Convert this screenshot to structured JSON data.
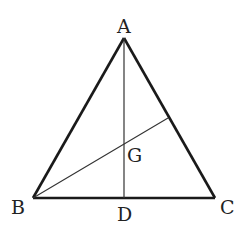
{
  "diagram": {
    "type": "triangle-with-cevians",
    "colors": {
      "stroke": "#1a1a1a",
      "label": "#222222",
      "background": "#ffffff"
    },
    "points": {
      "A": {
        "label": "A",
        "x": 124,
        "y": 38
      },
      "B": {
        "label": "B",
        "x": 33,
        "y": 198
      },
      "C": {
        "label": "C",
        "x": 215,
        "y": 198
      },
      "D": {
        "label": "D",
        "x": 124,
        "y": 198
      },
      "G": {
        "label": "G",
        "x": 124,
        "y": 143
      },
      "E": {
        "x": 168,
        "y": 118
      }
    },
    "segments": [
      {
        "from": "A",
        "to": "B",
        "style": "thick"
      },
      {
        "from": "A",
        "to": "C",
        "style": "thick"
      },
      {
        "from": "B",
        "to": "C",
        "style": "thick"
      },
      {
        "from": "A",
        "to": "D",
        "style": "thin"
      },
      {
        "from": "B",
        "to": "E",
        "style": "thin"
      }
    ]
  }
}
